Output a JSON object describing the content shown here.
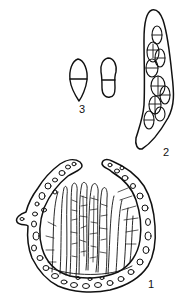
{
  "plate": {
    "background": "#ffffff",
    "ink_color": "#111111",
    "figures": [
      {
        "id": "1",
        "label": "1",
        "subject": "ascoma-section",
        "description": "Cup-shaped fruiting body in section with cellular excipulum and hymenium of asci and paraphyses"
      },
      {
        "id": "2",
        "label": "2",
        "subject": "ascus",
        "description": "Elongate club-shaped ascus containing muriform ascospores"
      },
      {
        "id": "3",
        "label": "3",
        "subject": "ascospores",
        "description": "Two single-septate ascospores"
      }
    ]
  }
}
